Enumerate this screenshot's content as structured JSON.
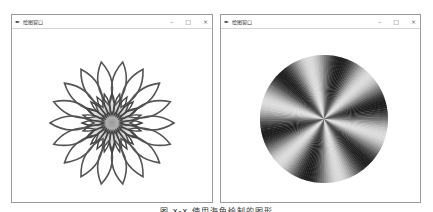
{
  "windows": [
    {
      "title": "绘图窗口",
      "controls": {
        "minimize": "–",
        "maximize": "□",
        "close": "×"
      },
      "figure": "spirograph-flower"
    },
    {
      "title": "绘图窗口",
      "controls": {
        "minimize": "–",
        "maximize": "□",
        "close": "×"
      },
      "figure": "radial-gradient-disc"
    }
  ],
  "icons": {
    "app": "✒"
  },
  "caption": "图 x-x  使用海龟绘制的图形"
}
